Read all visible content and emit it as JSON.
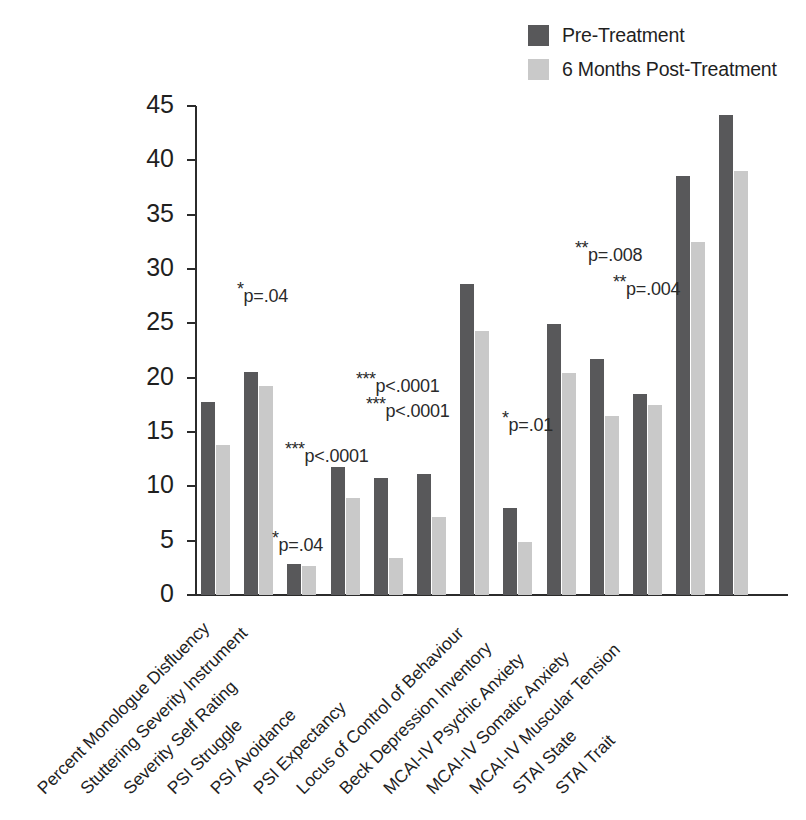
{
  "legend": {
    "position": "top-right",
    "items": [
      {
        "label": "Pre-Treatment",
        "color": "#58585a",
        "key": "pre"
      },
      {
        "label": "6 Months Post-Treatment",
        "color": "#c9c9c9",
        "key": "post"
      }
    ]
  },
  "axis": {
    "y_ticks": [
      "0",
      "5",
      "10",
      "15",
      "20",
      "25",
      "30",
      "35",
      "40",
      "45"
    ]
  },
  "annotations": [
    {
      "stars": "*",
      "text": "p=.04",
      "x": 237,
      "y": 279
    },
    {
      "stars": "*",
      "text": "p=.04",
      "x": 272,
      "y": 528
    },
    {
      "stars": "***",
      "text": "p<.0001",
      "x": 285,
      "y": 439
    },
    {
      "stars": "***",
      "text": "p<.0001",
      "x": 356,
      "y": 369
    },
    {
      "stars": "***",
      "text": "p<.0001",
      "x": 366,
      "y": 394
    },
    {
      "stars": "*",
      "text": "p=.01",
      "x": 502,
      "y": 408
    },
    {
      "stars": "**",
      "text": "p=.008",
      "x": 575,
      "y": 238
    },
    {
      "stars": "**",
      "text": "p=.004",
      "x": 613,
      "y": 272
    }
  ],
  "chart_data": {
    "type": "bar",
    "title": "",
    "xlabel": "",
    "ylabel": "",
    "ylim": [
      0,
      45
    ],
    "ytick_step": 5,
    "grid": false,
    "legend_position": "top-right",
    "categories": [
      "Percent Monologue Disfluency",
      "Stuttering Severity Instrument",
      "Severity Self Rating",
      "PSI Struggle",
      "PSI Avoidance",
      "PSI Expectancy",
      "Locus of Control of Behaviour",
      "Beck Depression Inventory",
      "MCAI-IV Psychic Anxiety",
      "MCAI-IV Somatic Anxiety",
      "MCAI-IV Muscular Tension",
      "STAI State",
      "STAI Trait"
    ],
    "series": [
      {
        "name": "Pre-Treatment",
        "color": "#58585a",
        "values": [
          17.8,
          20.5,
          2.9,
          11.8,
          10.8,
          11.1,
          28.6,
          8.0,
          24.9,
          21.7,
          18.5,
          38.6,
          44.2
        ]
      },
      {
        "name": "6 Months Post-Treatment",
        "color": "#c9c9c9",
        "values": [
          13.8,
          19.2,
          2.7,
          8.9,
          3.4,
          7.2,
          24.3,
          4.9,
          20.4,
          16.5,
          17.5,
          32.5,
          39.0
        ]
      }
    ],
    "significance": [
      {
        "category": "Stuttering Severity Instrument",
        "label": "*p=.04"
      },
      {
        "category": "Severity Self Rating",
        "label": "*p=.04"
      },
      {
        "category": "PSI Struggle",
        "label": "***p<.0001"
      },
      {
        "category": "PSI Avoidance",
        "label": "***p<.0001"
      },
      {
        "category": "PSI Expectancy",
        "label": "***p<.0001"
      },
      {
        "category": "Beck Depression Inventory",
        "label": "*p=.01"
      },
      {
        "category": "MCAI-IV Somatic Anxiety",
        "label": "**p=.008"
      },
      {
        "category": "STAI State",
        "label": "**p=.004"
      }
    ]
  }
}
